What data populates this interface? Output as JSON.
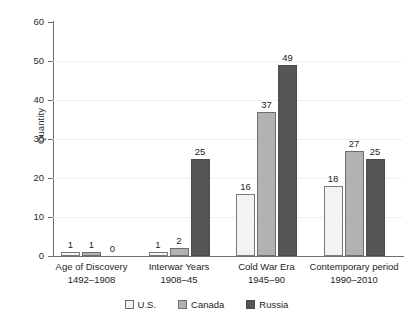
{
  "chart_data": {
    "type": "bar",
    "title": "",
    "subtitle": "",
    "xlabel": "",
    "ylabel": "Quantity",
    "ylim": [
      0,
      60
    ],
    "ytick_step": 10,
    "yticks": [
      "0",
      "10",
      "20",
      "30",
      "40",
      "50",
      "60"
    ],
    "grid": true,
    "legend_position": "bottom",
    "categories": [
      "Age of Discovery",
      "Interwar Years",
      "Cold War Era",
      "Contemporary period"
    ],
    "category_sublabels": [
      "1492–1908",
      "1908–45",
      "1945–90",
      "1990–2010"
    ],
    "series": [
      {
        "name": "U.S.",
        "color": "#f3f3f3",
        "values": [
          1,
          1,
          16,
          18
        ]
      },
      {
        "name": "Canada",
        "color": "#b2b2b2",
        "values": [
          1,
          2,
          37,
          27
        ]
      },
      {
        "name": "Russia",
        "color": "#565656",
        "values": [
          0,
          25,
          49,
          25
        ]
      }
    ],
    "data_labels": [
      [
        "1",
        "1",
        "16",
        "18"
      ],
      [
        "1",
        "2",
        "37",
        "27"
      ],
      [
        "0",
        "25",
        "49",
        "25"
      ]
    ]
  },
  "legend": {
    "items": [
      {
        "label": "U.S.",
        "swatch": "us"
      },
      {
        "label": "Canada",
        "swatch": "canada"
      },
      {
        "label": "Russia",
        "swatch": "russia"
      }
    ]
  },
  "colors": {
    "us": "#f3f3f3",
    "canada": "#b2b2b2",
    "russia": "#565656",
    "axis": "#6e6e6e",
    "grid": "#f0f0f0",
    "text": "#1e1e1e",
    "background": "#ffffff"
  }
}
